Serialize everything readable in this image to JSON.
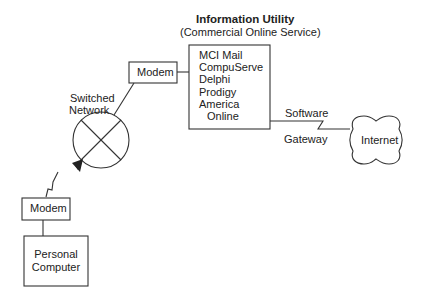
{
  "diagram": {
    "title": "Information Utility",
    "subtitle": "(Commercial Online Service)",
    "nodes": {
      "personal_computer": {
        "line1": "Personal",
        "line2": "Computer"
      },
      "modem_user": {
        "label": "Modem"
      },
      "switched_network": {
        "line1": "Switched",
        "line2": "Network"
      },
      "modem_utility": {
        "label": "Modem"
      },
      "information_utility": {
        "services": [
          "MCI Mail",
          "CompuServe",
          "Delphi",
          "Prodigy",
          "America",
          "Online"
        ]
      },
      "internet": {
        "label": "Internet"
      }
    },
    "edges": {
      "software_gateway_top": "Software",
      "software_gateway_bottom": "Gateway"
    },
    "colors": {
      "stroke": "#333333",
      "text": "#222222",
      "background": "#ffffff"
    }
  }
}
